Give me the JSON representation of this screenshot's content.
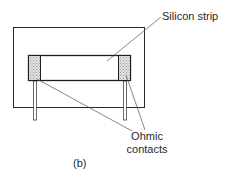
{
  "figure": {
    "caption": "(b)",
    "labels": {
      "silicon_strip": "Silicon strip",
      "ohmic_line1": "Ohmic",
      "ohmic_line2": "contacts"
    },
    "colors": {
      "stroke": "#2a2a2a",
      "contact_fill": "#d8d8d8",
      "background": "#ffffff"
    },
    "components": [
      {
        "name": "substrate-frame",
        "shape": "rectangle"
      },
      {
        "name": "silicon-strip",
        "shape": "rectangle"
      },
      {
        "name": "ohmic-contact-left",
        "shape": "hatched-rectangle"
      },
      {
        "name": "ohmic-contact-right",
        "shape": "hatched-rectangle"
      },
      {
        "name": "lead-left",
        "shape": "thin-rectangle"
      },
      {
        "name": "lead-right",
        "shape": "thin-rectangle"
      }
    ]
  }
}
